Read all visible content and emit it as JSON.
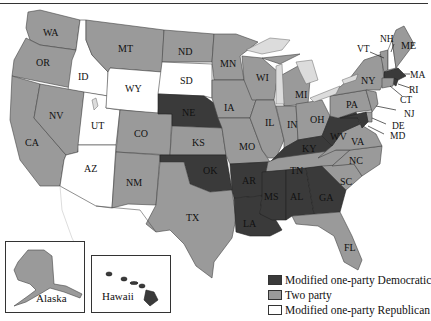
{
  "legend": {
    "items": [
      {
        "label": "Modified one-party Democratic",
        "color": "#3a3a3a"
      },
      {
        "label": "Two party",
        "color": "#9a9a9a"
      },
      {
        "label": "Modified one-party Republican",
        "color": "#ffffff"
      }
    ]
  },
  "insets": {
    "alaska": {
      "label": "Alaska",
      "category": "Two party"
    },
    "hawaii": {
      "label": "Hawaii",
      "category": "Modified one-party Democratic"
    }
  },
  "states": {
    "WA": {
      "label": "WA",
      "category": "Two party"
    },
    "OR": {
      "label": "OR",
      "category": "Two party"
    },
    "CA": {
      "label": "CA",
      "category": "Two party"
    },
    "ID": {
      "label": "ID",
      "category": "Modified one-party Republican"
    },
    "NV": {
      "label": "NV",
      "category": "Two party"
    },
    "UT": {
      "label": "UT",
      "category": "Modified one-party Republican"
    },
    "AZ": {
      "label": "AZ",
      "category": "Modified one-party Republican"
    },
    "MT": {
      "label": "MT",
      "category": "Two party"
    },
    "WY": {
      "label": "WY",
      "category": "Modified one-party Republican"
    },
    "CO": {
      "label": "CO",
      "category": "Two party"
    },
    "NM": {
      "label": "NM",
      "category": "Two party"
    },
    "ND": {
      "label": "ND",
      "category": "Two party"
    },
    "SD": {
      "label": "SD",
      "category": "Modified one-party Republican"
    },
    "NE": {
      "label": "NE",
      "category": "Modified one-party Democratic"
    },
    "KS": {
      "label": "KS",
      "category": "Two party"
    },
    "OK": {
      "label": "OK",
      "category": "Modified one-party Democratic"
    },
    "TX": {
      "label": "TX",
      "category": "Two party"
    },
    "MN": {
      "label": "MN",
      "category": "Two party"
    },
    "IA": {
      "label": "IA",
      "category": "Two party"
    },
    "MO": {
      "label": "MO",
      "category": "Two party"
    },
    "AR": {
      "label": "AR",
      "category": "Modified one-party Democratic"
    },
    "LA": {
      "label": "LA",
      "category": "Modified one-party Democratic"
    },
    "WI": {
      "label": "WI",
      "category": "Two party"
    },
    "IL": {
      "label": "IL",
      "category": "Two party"
    },
    "MI": {
      "label": "MI",
      "category": "Two party"
    },
    "IN": {
      "label": "IN",
      "category": "Two party"
    },
    "OH": {
      "label": "OH",
      "category": "Two party"
    },
    "KY": {
      "label": "KY",
      "category": "Modified one-party Democratic"
    },
    "TN": {
      "label": "TN",
      "category": "Two party"
    },
    "MS": {
      "label": "MS",
      "category": "Modified one-party Democratic"
    },
    "AL": {
      "label": "AL",
      "category": "Modified one-party Democratic"
    },
    "GA": {
      "label": "GA",
      "category": "Modified one-party Democratic"
    },
    "FL": {
      "label": "FL",
      "category": "Two party"
    },
    "SC": {
      "label": "SC",
      "category": "Two party"
    },
    "NC": {
      "label": "NC",
      "category": "Two party"
    },
    "VA": {
      "label": "VA",
      "category": "Two party"
    },
    "WV": {
      "label": "WV",
      "category": "Modified one-party Democratic"
    },
    "PA": {
      "label": "PA",
      "category": "Two party"
    },
    "NY": {
      "label": "NY",
      "category": "Two party"
    },
    "VT": {
      "label": "VT",
      "category": "Two party"
    },
    "NH": {
      "label": "NH",
      "category": "Modified one-party Republican"
    },
    "ME": {
      "label": "ME",
      "category": "Two party"
    },
    "MA": {
      "label": "MA",
      "category": "Modified one-party Democratic"
    },
    "RI": {
      "label": "RI",
      "category": "Modified one-party Democratic"
    },
    "CT": {
      "label": "CT",
      "category": "Two party"
    },
    "NJ": {
      "label": "NJ",
      "category": "Two party"
    },
    "DE": {
      "label": "DE",
      "category": "Two party"
    },
    "MD": {
      "label": "MD",
      "category": "Modified one-party Democratic"
    }
  }
}
